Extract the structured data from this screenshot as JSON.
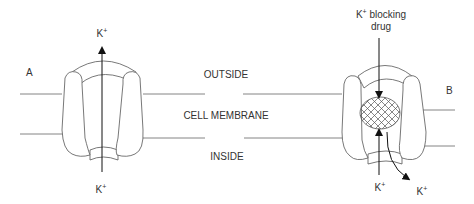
{
  "diagram": {
    "regions": {
      "outside": "OUTSIDE",
      "membrane": "CELL MEMBRANE",
      "inside": "INSIDE"
    },
    "panel_a": {
      "label": "A",
      "ion_top": "K",
      "ion_top_charge": "+",
      "ion_bottom": "K",
      "ion_bottom_charge": "+"
    },
    "panel_b": {
      "label": "B",
      "drug_label_prefix": "K",
      "drug_label_charge": "+",
      "drug_label_suffix": " blocking",
      "drug_label_line2": "drug",
      "ion_in": "K",
      "ion_in_charge": "+",
      "ion_out": "K",
      "ion_out_charge": "+"
    },
    "colors": {
      "stroke": "#555555",
      "arrow": "#111111",
      "text": "#333333"
    }
  }
}
